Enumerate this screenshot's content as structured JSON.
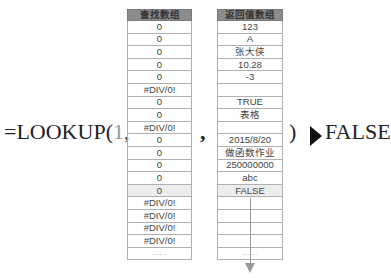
{
  "formula": {
    "prefix": "=LOOKUP(",
    "lookup_value": "1",
    "comma1": ",",
    "comma2": ",",
    "close": ")",
    "arrow_icon": "right-triangle",
    "result": "FALSE"
  },
  "lookup_table": {
    "header": "查找数组",
    "rows": [
      "0",
      "0",
      "0",
      "0",
      "0",
      "#DIV/0!",
      "0",
      "0",
      "#DIV/0!",
      "0",
      "0",
      "0",
      "0",
      "0",
      "#DIV/0!",
      "#DIV/0!",
      "#DIV/0!",
      "#DIV/0!",
      "......"
    ]
  },
  "return_table": {
    "header": "返回值数组",
    "rows": [
      "123",
      "A",
      "张大侠",
      "10.28",
      "-3",
      "",
      "TRUE",
      "表格",
      "",
      "2015/8/20",
      "做函数作业",
      "250000000",
      "abc",
      "FALSE",
      "",
      "",
      "",
      "",
      "......"
    ]
  },
  "highlight_row_index": 13,
  "colors": {
    "header_bg": "#8c8c8c",
    "highlight_bg": "#ededed",
    "arrow_down": "#999999"
  }
}
